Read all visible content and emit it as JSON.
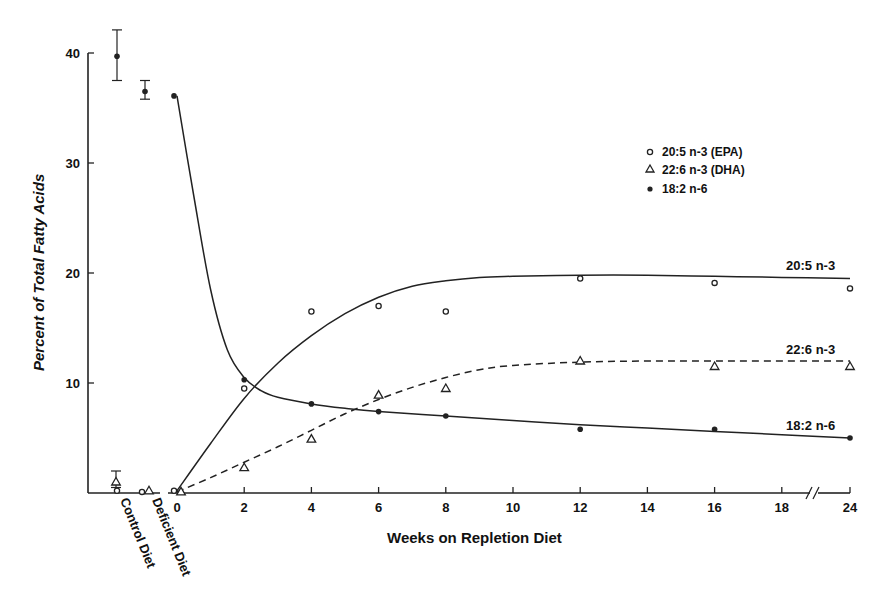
{
  "chart_data": {
    "type": "line",
    "title": "",
    "xlabel": "Weeks on Repletion Diet",
    "ylabel": "Percent of Total Fatty Acids",
    "ylim": [
      0,
      40
    ],
    "yticks": [
      10,
      20,
      30,
      40
    ],
    "xticks": [
      0,
      2,
      4,
      6,
      8,
      10,
      12,
      14,
      16,
      18,
      24
    ],
    "x_axis_break": "between 18 and 24",
    "grid": false,
    "legend_position": "top-right",
    "baseline_categories": [
      "Control Diet",
      "Deficient Diet"
    ],
    "legend": [
      {
        "marker": "open-circle",
        "label": "20:5 n-3 (EPA)"
      },
      {
        "marker": "open-triangle",
        "label": "22:6 n-3 (DHA)"
      },
      {
        "marker": "filled-circle",
        "label": "18:2 n-6"
      }
    ],
    "series": [
      {
        "name": "20:5 n-3",
        "legend_label": "20:5 n-3 (EPA)",
        "marker": "open-circle",
        "line_style": "solid",
        "baseline": {
          "Control Diet": 0.2,
          "Deficient Diet": 0.1
        },
        "x": [
          0,
          2,
          4,
          6,
          8,
          12,
          16,
          24
        ],
        "values": [
          0.2,
          9.5,
          16.5,
          17.0,
          16.5,
          19.5,
          19.1,
          18.6
        ],
        "fit_x": [
          0,
          1,
          2,
          3,
          4,
          5,
          6,
          7,
          8,
          9,
          10,
          12,
          14,
          16,
          18,
          24
        ],
        "fit_values": [
          0.2,
          4.5,
          8.6,
          11.8,
          14.3,
          16.3,
          17.8,
          18.8,
          19.3,
          19.6,
          19.7,
          19.8,
          19.8,
          19.7,
          19.6,
          19.5
        ]
      },
      {
        "name": "22:6 n-3",
        "legend_label": "22:6 n-3 (DHA)",
        "marker": "open-triangle",
        "line_style": "dashed",
        "baseline": {
          "Control Diet": 1.0,
          "Deficient Diet": 0.2
        },
        "baseline_error": {
          "Control Diet": [
            0.5,
            2.0
          ]
        },
        "x": [
          0,
          2,
          4,
          6,
          8,
          12,
          16,
          24
        ],
        "values": [
          0.1,
          2.3,
          4.9,
          8.9,
          9.5,
          12.0,
          11.5,
          11.5
        ],
        "fit_x": [
          0,
          1,
          2,
          3,
          4,
          5,
          6,
          7,
          8,
          9,
          10,
          12,
          14,
          16,
          18,
          24
        ],
        "fit_values": [
          0.1,
          1.4,
          2.8,
          4.2,
          5.7,
          7.2,
          8.5,
          9.6,
          10.5,
          11.2,
          11.6,
          11.9,
          12.0,
          12.0,
          12.0,
          12.0
        ]
      },
      {
        "name": "18:2 n-6",
        "legend_label": "18:2 n-6",
        "marker": "filled-circle",
        "line_style": "solid",
        "baseline": {
          "Control Diet": 39.7,
          "Deficient Diet": 36.5
        },
        "baseline_error": {
          "Control Diet": [
            37.5,
            42.1
          ],
          "Deficient Diet": [
            35.8,
            37.5
          ]
        },
        "x": [
          0,
          2,
          4,
          6,
          8,
          12,
          16,
          24
        ],
        "values": [
          36.1,
          10.3,
          8.1,
          7.4,
          7.0,
          5.8,
          5.8,
          5.0
        ],
        "fit_x": [
          0,
          0.5,
          1,
          1.5,
          2,
          2.5,
          3,
          4,
          5,
          6,
          8,
          10,
          12,
          14,
          16,
          18,
          24
        ],
        "fit_values": [
          36.1,
          27.0,
          18.5,
          13.0,
          10.5,
          9.3,
          8.7,
          8.1,
          7.7,
          7.4,
          7.0,
          6.6,
          6.2,
          5.9,
          5.6,
          5.3,
          5.0
        ]
      }
    ]
  }
}
